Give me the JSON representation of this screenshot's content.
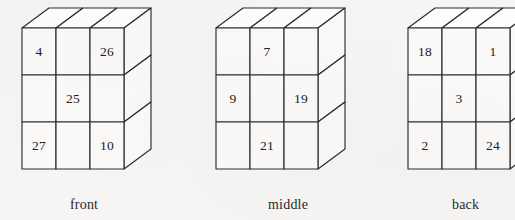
{
  "figure": {
    "title": "",
    "background_color": "#f6f5f3",
    "ink_color": "#2e2c2b",
    "face_fill": "#fbfaf8",
    "projection": "oblique",
    "blocks": [
      {
        "id": "front",
        "caption": "front",
        "caption_x": 70,
        "caption_y": 197,
        "origin_x": 22,
        "origin_y": 28,
        "cell_w": 34,
        "cell_h": 47,
        "depth_dx": 27,
        "depth_dy": -20,
        "rows": 3,
        "cols": 3,
        "cells": [
          {
            "row": 0,
            "col": 0,
            "value": "4"
          },
          {
            "row": 0,
            "col": 1,
            "value": ""
          },
          {
            "row": 0,
            "col": 2,
            "value": "26"
          },
          {
            "row": 1,
            "col": 0,
            "value": ""
          },
          {
            "row": 1,
            "col": 1,
            "value": "25"
          },
          {
            "row": 1,
            "col": 2,
            "value": ""
          },
          {
            "row": 2,
            "col": 0,
            "value": "27"
          },
          {
            "row": 2,
            "col": 1,
            "value": ""
          },
          {
            "row": 2,
            "col": 2,
            "value": "10"
          }
        ]
      },
      {
        "id": "middle",
        "caption": "middle",
        "caption_x": 268,
        "caption_y": 197,
        "origin_x": 216,
        "origin_y": 28,
        "cell_w": 34,
        "cell_h": 47,
        "depth_dx": 27,
        "depth_dy": -20,
        "rows": 3,
        "cols": 3,
        "cells": [
          {
            "row": 0,
            "col": 0,
            "value": ""
          },
          {
            "row": 0,
            "col": 1,
            "value": "7"
          },
          {
            "row": 0,
            "col": 2,
            "value": ""
          },
          {
            "row": 1,
            "col": 0,
            "value": "9"
          },
          {
            "row": 1,
            "col": 1,
            "value": ""
          },
          {
            "row": 1,
            "col": 2,
            "value": "19"
          },
          {
            "row": 2,
            "col": 0,
            "value": ""
          },
          {
            "row": 2,
            "col": 1,
            "value": "21"
          },
          {
            "row": 2,
            "col": 2,
            "value": ""
          }
        ]
      },
      {
        "id": "back",
        "caption": "back",
        "caption_x": 452,
        "caption_y": 197,
        "origin_x": 408,
        "origin_y": 28,
        "cell_w": 34,
        "cell_h": 47,
        "depth_dx": 27,
        "depth_dy": -20,
        "rows": 3,
        "cols": 3,
        "cells": [
          {
            "row": 0,
            "col": 0,
            "value": "18"
          },
          {
            "row": 0,
            "col": 1,
            "value": ""
          },
          {
            "row": 0,
            "col": 2,
            "value": "1"
          },
          {
            "row": 1,
            "col": 0,
            "value": ""
          },
          {
            "row": 1,
            "col": 1,
            "value": "3"
          },
          {
            "row": 1,
            "col": 2,
            "value": ""
          },
          {
            "row": 2,
            "col": 0,
            "value": "2"
          },
          {
            "row": 2,
            "col": 1,
            "value": ""
          },
          {
            "row": 2,
            "col": 2,
            "value": "24"
          }
        ]
      }
    ]
  }
}
